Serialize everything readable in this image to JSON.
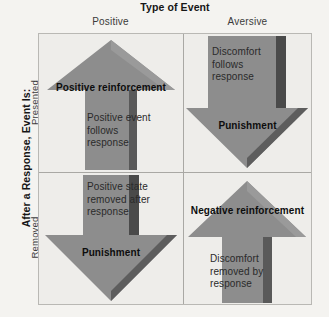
{
  "diagram": {
    "column_axis_title": "Type of Event",
    "row_axis_title": "After a Response, Event Is:",
    "columns": [
      {
        "key": "positive",
        "label": "Positive"
      },
      {
        "key": "aversive",
        "label": "Aversive"
      }
    ],
    "rows": [
      {
        "key": "presented",
        "label": "Presented"
      },
      {
        "key": "removed",
        "label": "Removed"
      }
    ],
    "colors": {
      "background": "#f4f3f0",
      "cell_background": "#eeedea",
      "arrow_fill": "#8d8d8d",
      "arrow_shadow": "#4e4e4e",
      "grid_line": "#a9a8a4",
      "title_text": "#161616",
      "body_text": "#2a2a2a"
    },
    "cells": {
      "presented_positive": {
        "outcome": "Positive reinforcement",
        "description": "Positive event follows response",
        "arrow_direction": "up"
      },
      "presented_aversive": {
        "outcome": "Punishment",
        "description": "Discomfort follows response",
        "arrow_direction": "down"
      },
      "removed_positive": {
        "outcome": "Punishment",
        "description": "Positive state removed after response",
        "arrow_direction": "down"
      },
      "removed_aversive": {
        "outcome": "Negative reinforcement",
        "description": "Discomfort removed by response",
        "arrow_direction": "up"
      }
    }
  }
}
